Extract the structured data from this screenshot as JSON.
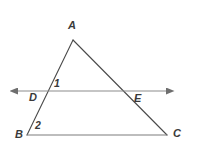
{
  "figure": {
    "type": "geometry-diagram",
    "background_color": "#ffffff",
    "stroke_color": "#4a4a4a",
    "line_color": "#8c8c8c",
    "label_color": "#3a3a3a"
  },
  "labels": {
    "vertex_a": "A",
    "vertex_b": "B",
    "vertex_c": "C",
    "point_d": "D",
    "point_e": "E",
    "angle_one": "1",
    "angle_two": "2"
  },
  "points": {
    "A": {
      "x": 73,
      "y": 40
    },
    "B": {
      "x": 27,
      "y": 135
    },
    "C": {
      "x": 167,
      "y": 135
    },
    "D": {
      "x": 41,
      "y": 91
    },
    "E": {
      "x": 131,
      "y": 91
    },
    "line_left_end": {
      "x": 13,
      "y": 91
    },
    "line_right_end": {
      "x": 171,
      "y": 91
    }
  },
  "segments": [
    {
      "name": "AB",
      "from": "A",
      "to": "B"
    },
    {
      "name": "AC",
      "from": "A",
      "to": "C"
    },
    {
      "name": "BC",
      "from": "B",
      "to": "C"
    },
    {
      "name": "DE",
      "from": "line_left_end",
      "to": "line_right_end"
    }
  ]
}
